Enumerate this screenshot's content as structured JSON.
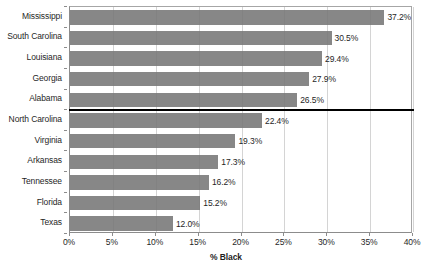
{
  "chart_data": {
    "type": "bar",
    "orientation": "horizontal",
    "title": "",
    "xlabel": "% Black",
    "ylabel": "",
    "xlim": [
      0,
      40
    ],
    "xticks": [
      0,
      5,
      10,
      15,
      20,
      25,
      30,
      35,
      40
    ],
    "xtick_labels": [
      "0%",
      "5%",
      "10%",
      "15%",
      "20%",
      "25%",
      "30%",
      "35%",
      "40%"
    ],
    "grid": "vertical",
    "legend": "none",
    "bar_color": "#767676",
    "categories": [
      "Mississippi",
      "South Carolina",
      "Louisiana",
      "Georgia",
      "Alabama",
      "North Carolina",
      "Virginia",
      "Arkansas",
      "Tennessee",
      "Florida",
      "Texas"
    ],
    "values": [
      37.2,
      30.5,
      29.4,
      27.9,
      26.5,
      22.4,
      19.3,
      17.3,
      16.2,
      15.2,
      12.0
    ],
    "value_labels": [
      "37.2%",
      "30.5%",
      "29.4%",
      "27.9%",
      "26.5%",
      "22.4%",
      "19.3%",
      "17.3%",
      "16.2%",
      "15.2%",
      "12.0%"
    ],
    "annotations": [
      {
        "type": "horizontal-rule",
        "after_category": "Alabama",
        "color": "#000000",
        "description": "thick black separator line between Alabama and North Carolina"
      }
    ]
  }
}
